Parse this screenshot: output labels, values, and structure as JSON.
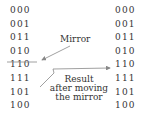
{
  "left_column": [
    "000",
    "001",
    "011",
    "010",
    "110",
    "111",
    "101",
    "100"
  ],
  "right_column": [
    "000",
    "001",
    "011",
    "010",
    "110",
    "111",
    "101",
    "100"
  ],
  "labels": {
    "mirror": "Mirror",
    "result_line1": "Result",
    "result_line2": "after moving",
    "result_line3": "the mirror"
  },
  "colors": {
    "text": "#333333",
    "line": "#888888"
  }
}
